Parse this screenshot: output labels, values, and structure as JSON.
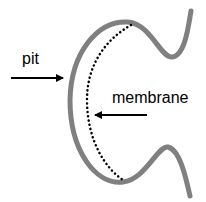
{
  "diagram": {
    "type": "schematic",
    "labels": {
      "pit": "pit",
      "membrane": "membrane"
    },
    "colors": {
      "pit_outline": "#808080",
      "membrane_dots": "#000000",
      "arrows": "#000000",
      "background": "#ffffff"
    },
    "shapes": {
      "pit_outline": "curved C-shaped pit wall (gray thick line)",
      "membrane": "dotted arc inside pit",
      "pit_arrow": "arrow pointing right toward pit wall",
      "membrane_arrow": "arrow pointing left toward dotted membrane"
    }
  }
}
